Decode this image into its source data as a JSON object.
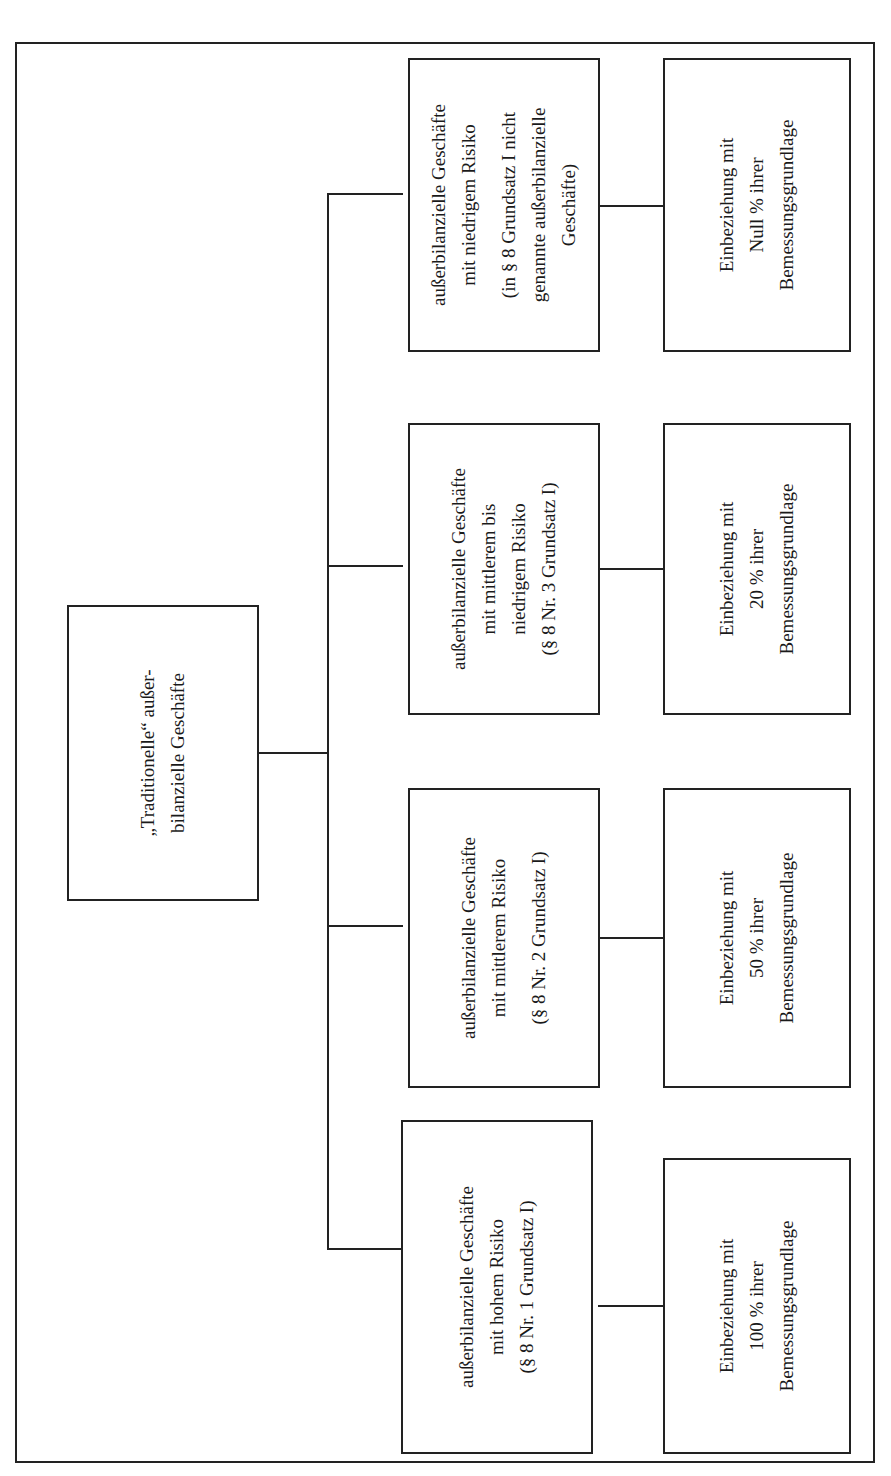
{
  "diagram": {
    "orientation": "rotated-90-ccw",
    "root": {
      "lines": [
        "„Traditionelle“ außer-",
        "bilanzielle Geschäfte"
      ]
    },
    "categories": [
      {
        "title_lines": [
          "außerbilanzielle Geschäfte",
          "mit niedrigem Risiko"
        ],
        "ref_lines": [
          "(in § 8 Grundsatz I nicht",
          "genannte außerbilanzielle",
          "Geschäfte)"
        ],
        "result_lines": [
          "Einbeziehung mit",
          "Null % ihrer",
          "Bemessungsgrundlage"
        ]
      },
      {
        "title_lines": [
          "außerbilanzielle Geschäfte",
          "mit mittlerem bis",
          "niedrigem Risiko"
        ],
        "ref_lines": [
          "(§ 8 Nr. 3 Grundsatz I)"
        ],
        "result_lines": [
          "Einbeziehung mit",
          "20 % ihrer",
          "Bemessungsgrundlage"
        ]
      },
      {
        "title_lines": [
          "außerbilanzielle Geschäfte",
          "mit mittlerem Risiko"
        ],
        "ref_lines": [
          "(§ 8 Nr. 2 Grundsatz I)"
        ],
        "result_lines": [
          "Einbeziehung mit",
          "50 % ihrer",
          "Bemessungsgrundlage"
        ]
      },
      {
        "title_lines": [
          "außerbilanzielle Geschäfte",
          "mit hohem Risiko"
        ],
        "ref_lines": [
          "(§ 8 Nr. 1 Grundsatz I)"
        ],
        "result_lines": [
          "Einbeziehung mit",
          "100 % ihrer",
          "Bemessungsgrundlage"
        ]
      }
    ]
  }
}
